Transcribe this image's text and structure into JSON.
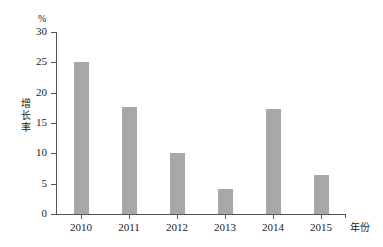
{
  "chart_data": {
    "type": "bar",
    "title": "",
    "subtitle": "",
    "categories": [
      "2010",
      "2011",
      "2012",
      "2013",
      "2014",
      "2015"
    ],
    "values": [
      25.0,
      17.6,
      10.0,
      4.1,
      17.3,
      6.4
    ],
    "series": [
      {
        "name": "增长率",
        "values": [
          25.0,
          17.6,
          10.0,
          4.1,
          17.3,
          6.4
        ]
      }
    ],
    "xlabel": "年份",
    "ylabel": "增长率",
    "yunit": "%",
    "ylim": [
      0,
      30
    ],
    "yticks": [
      0,
      5,
      10,
      15,
      20,
      25,
      30
    ],
    "ytick_labels": [
      "0",
      "5",
      "10",
      "15",
      "20",
      "25",
      "30"
    ],
    "grid": false,
    "legend": false,
    "legend_position": "none",
    "bar_color": "#a8a8a8",
    "axis_color": "#555555",
    "background_color": "#ffffff",
    "annotations": []
  }
}
